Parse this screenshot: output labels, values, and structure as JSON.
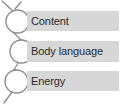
{
  "diagram": {
    "node_fill": "#ffffff",
    "node_stroke": "#8c8c8c",
    "connector_color": "#8c8c8c",
    "bar_color": "#d7d7d7",
    "text_color": "#2b2b2b",
    "background": "#ffffff",
    "items": [
      {
        "label": "Content",
        "icon": "circle-node-icon"
      },
      {
        "label": "Body language",
        "icon": "circle-node-icon"
      },
      {
        "label": "Energy",
        "icon": "circle-node-icon"
      }
    ]
  }
}
